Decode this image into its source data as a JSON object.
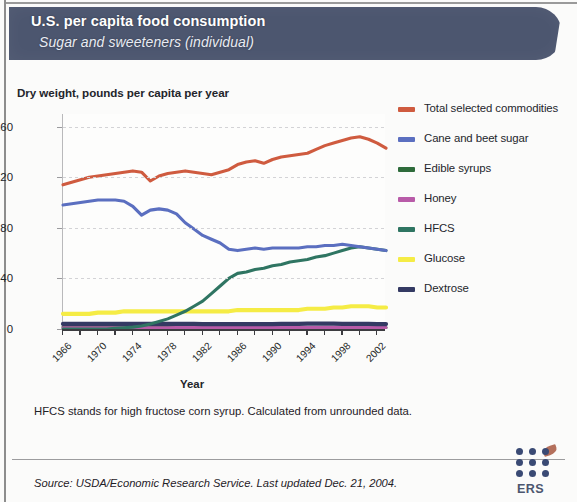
{
  "header": {
    "title": "U.S. per capita food consumption",
    "subtitle": "Sugar and sweeteners (individual)"
  },
  "chart_data": {
    "type": "line",
    "ylabel": "Dry weight, pounds per capita per year",
    "xlabel": "Year",
    "ylim": [
      0,
      170
    ],
    "xlim": [
      1966,
      2003
    ],
    "yticks": [
      0,
      40,
      80,
      120,
      160
    ],
    "xticks": [
      1966,
      1970,
      1974,
      1978,
      1982,
      1986,
      1990,
      1994,
      1998,
      2002
    ],
    "grid": true,
    "legend_position": "right",
    "x": [
      1966,
      1967,
      1968,
      1969,
      1970,
      1971,
      1972,
      1973,
      1974,
      1975,
      1976,
      1977,
      1978,
      1979,
      1980,
      1981,
      1982,
      1983,
      1984,
      1985,
      1986,
      1987,
      1988,
      1989,
      1990,
      1991,
      1992,
      1993,
      1994,
      1995,
      1996,
      1997,
      1998,
      1999,
      2000,
      2001,
      2002,
      2003
    ],
    "series": [
      {
        "name": "Total selected commodities",
        "color": "#cf5b3f",
        "values": [
          114,
          116,
          118,
          120,
          121,
          122,
          123,
          124,
          125,
          124,
          117,
          121,
          123,
          124,
          125,
          124,
          123,
          122,
          124,
          126,
          130,
          132,
          133,
          131,
          134,
          136,
          137,
          138,
          139,
          142,
          145,
          147,
          149,
          151,
          152,
          150,
          147,
          143
        ]
      },
      {
        "name": "Cane and beet sugar",
        "color": "#5b6fc0",
        "values": [
          98,
          99,
          100,
          101,
          102,
          102,
          102,
          101,
          97,
          90,
          94,
          95,
          94,
          91,
          84,
          79,
          74,
          71,
          68,
          63,
          62,
          63,
          64,
          63,
          64,
          64,
          64,
          64,
          65,
          65,
          66,
          66,
          67,
          66,
          65,
          64,
          63,
          62
        ]
      },
      {
        "name": "Edible syrups",
        "color": "#2e6b3b",
        "values": [
          1.5,
          1.5,
          1.5,
          1.4,
          1.4,
          1.4,
          1.4,
          1.3,
          1.3,
          1.3,
          1.3,
          1.3,
          1.2,
          1.2,
          1.2,
          1.2,
          1.2,
          1.2,
          1.2,
          1.2,
          1.2,
          1.2,
          1.2,
          1.2,
          1.2,
          1.2,
          1.2,
          1.2,
          1.2,
          1.2,
          1.2,
          1.2,
          1.2,
          1.2,
          1.2,
          1.2,
          1.2,
          1.2
        ]
      },
      {
        "name": "Honey",
        "color": "#b85ba8",
        "values": [
          1.0,
          1.0,
          1.0,
          1.0,
          1.0,
          1.0,
          1.0,
          1.0,
          1.0,
          1.0,
          1.0,
          1.0,
          1.0,
          1.1,
          1.1,
          1.1,
          1.1,
          1.1,
          1.1,
          1.2,
          1.2,
          1.2,
          1.2,
          1.2,
          1.2,
          1.2,
          1.2,
          1.2,
          1.2,
          1.2,
          1.3,
          1.3,
          1.3,
          1.3,
          1.3,
          1.3,
          1.2,
          1.2
        ]
      },
      {
        "name": "HFCS",
        "color": "#2f7562",
        "values": [
          0,
          0,
          0,
          0,
          0,
          0,
          0.6,
          1.0,
          1.5,
          2.4,
          4.0,
          6.0,
          8.0,
          11.0,
          14.0,
          18.0,
          22.0,
          28.0,
          34.0,
          40.0,
          44.0,
          45.0,
          47.0,
          48.0,
          50.0,
          51.0,
          53.0,
          54.0,
          55.0,
          57.0,
          58.0,
          60.0,
          62.0,
          64.0,
          65.0,
          64.0,
          63.0,
          62.0
        ]
      },
      {
        "name": "Glucose",
        "color": "#f5ec45",
        "values": [
          12,
          12,
          12,
          12,
          13,
          13,
          13,
          14,
          14,
          14,
          14,
          14,
          14,
          14,
          14,
          14,
          14,
          14,
          14,
          14,
          15,
          15,
          15,
          15,
          15,
          15,
          15,
          15,
          16,
          16,
          16,
          17,
          17,
          18,
          18,
          18,
          17,
          17
        ]
      },
      {
        "name": "Dextrose",
        "color": "#343a63",
        "values": [
          4.0,
          4.0,
          4.0,
          4.0,
          4.0,
          4.0,
          4.0,
          4.0,
          4.0,
          4.0,
          4.0,
          4.0,
          4.0,
          4.0,
          4.0,
          4.0,
          3.9,
          3.9,
          3.9,
          3.9,
          3.9,
          3.9,
          3.9,
          3.9,
          3.9,
          4.0,
          4.0,
          4.0,
          4.2,
          4.3,
          4.3,
          4.2,
          4.1,
          4.0,
          4.0,
          4.0,
          3.9,
          3.9
        ]
      }
    ]
  },
  "legend": [
    {
      "label": "Total selected commodities",
      "color": "#cf5b3f"
    },
    {
      "label": "Cane and beet sugar",
      "color": "#5b6fc0"
    },
    {
      "label": "Edible syrups",
      "color": "#2e6b3b"
    },
    {
      "label": "Honey",
      "color": "#b85ba8"
    },
    {
      "label": "HFCS",
      "color": "#2f7562"
    },
    {
      "label": "Glucose",
      "color": "#f5ec45"
    },
    {
      "label": "Dextrose",
      "color": "#343a63"
    }
  ],
  "notes": {
    "footnote": "HFCS stands for high fructose corn syrup. Calculated from unrounded data.",
    "source": "Source: USDA/Economic Research Service. Last updated Dec. 21, 2004."
  },
  "logo": {
    "text": "ERS"
  }
}
